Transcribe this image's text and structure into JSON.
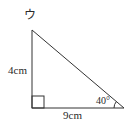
{
  "figure": {
    "label": "ウ",
    "shape": "right-triangle",
    "height_label": "4cm",
    "base_label": "9cm",
    "angle_label": "40°"
  },
  "colors": {
    "stroke": "#333333",
    "text": "#2a2a2a"
  }
}
